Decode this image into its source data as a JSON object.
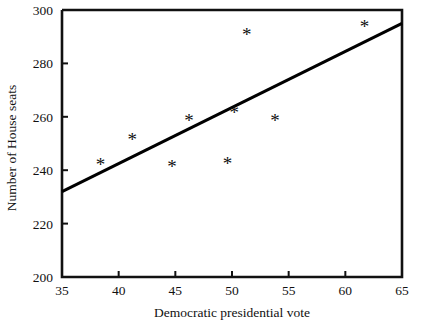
{
  "chart_data": {
    "type": "scatter",
    "title": "",
    "xlabel": "Democratic presidential vote",
    "ylabel": "Number of House seats",
    "xlim": [
      35,
      65
    ],
    "ylim": [
      200,
      300
    ],
    "xticks": [
      35,
      40,
      45,
      50,
      55,
      60,
      65
    ],
    "xtick_labels": [
      "35",
      "40",
      "45",
      "50",
      "55",
      "60",
      "65"
    ],
    "yticks": [
      200,
      220,
      240,
      260,
      280,
      300
    ],
    "ytick_labels": [
      "200",
      "220",
      "240",
      "260",
      "280",
      "300"
    ],
    "grid": false,
    "legend": null,
    "marker": "*",
    "marker_color": "#111111",
    "points": [
      {
        "x": 38.4,
        "y": 242.0
      },
      {
        "x": 41.2,
        "y": 251.5
      },
      {
        "x": 44.7,
        "y": 241.5
      },
      {
        "x": 46.2,
        "y": 258.5
      },
      {
        "x": 49.6,
        "y": 242.5
      },
      {
        "x": 50.2,
        "y": 261.5
      },
      {
        "x": 51.3,
        "y": 291.0
      },
      {
        "x": 53.8,
        "y": 258.5
      },
      {
        "x": 61.7,
        "y": 294.0
      }
    ],
    "fit_line": {
      "type": "line",
      "color": "#000000",
      "x": [
        35,
        65
      ],
      "y": [
        232.0,
        295.0
      ]
    }
  }
}
